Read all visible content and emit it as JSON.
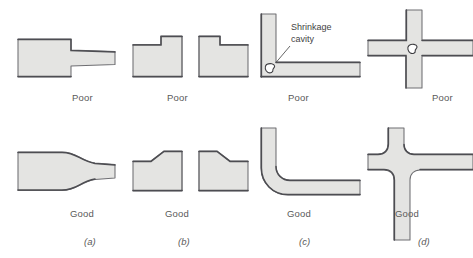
{
  "figure": {
    "colors": {
      "fill": "#e4e4e2",
      "outline_dark": "#55555a",
      "outline_light": "#9a9a9a",
      "text": "#4f4f4f",
      "background": "#ffffff"
    },
    "rows": [
      {
        "id": "top",
        "label": "Poor"
      },
      {
        "id": "bottom",
        "label": "Good"
      }
    ],
    "panels": [
      {
        "letter": "(a)",
        "top_label": "Poor",
        "bottom_label": "Good",
        "top_description": "Abrupt step between thick and thin section",
        "bottom_description": "Gradual tapered transition between sections"
      },
      {
        "letter": "(b)",
        "top_label": "Poor",
        "bottom_label": "Good",
        "top_description": "Square-shouldered raised boss with cored hole",
        "bottom_description": "Tapered shoulders on raised boss with cored hole"
      },
      {
        "letter": "(c)",
        "top_label": "Poor",
        "bottom_label": "Good",
        "top_description": "Sharp right-angle corner producing a shrinkage cavity",
        "bottom_description": "Generously radiused corner, no shrinkage cavity"
      },
      {
        "letter": "(d)",
        "top_label": "Poor",
        "bottom_label": "Good",
        "top_description": "Cross junction with hot spot and shrinkage cavity at center",
        "bottom_description": "Staggered tee junctions with fillets avoid the hot spot"
      }
    ],
    "annotations": [
      {
        "id": "shrinkage-cavity",
        "line1": "Shrinkage",
        "line2": "cavity",
        "points_to": "cavity void at inner corner of panel (c)"
      }
    ]
  }
}
